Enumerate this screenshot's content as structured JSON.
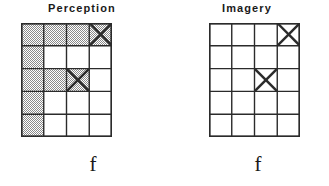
{
  "figure": {
    "background_color": "#ffffff",
    "stroke_color": "#2b2b2b",
    "shade_color": "#8a8a8a",
    "grid": {
      "columns": 4,
      "rows": 5
    }
  },
  "panels": [
    {
      "key": "perception",
      "title": "Perception",
      "label": "f",
      "shaded_cells": [
        [
          1,
          1
        ],
        [
          1,
          2
        ],
        [
          1,
          3
        ],
        [
          1,
          4
        ],
        [
          2,
          1
        ],
        [
          3,
          1
        ],
        [
          3,
          2
        ],
        [
          3,
          3
        ],
        [
          4,
          1
        ],
        [
          5,
          1
        ]
      ],
      "x_marks": [
        {
          "row": 1,
          "col": 4
        },
        {
          "row": 3,
          "col": 3
        }
      ]
    },
    {
      "key": "imagery",
      "title": "Imagery",
      "label": "f",
      "shaded_cells": [],
      "x_marks": [
        {
          "row": 1,
          "col": 4
        },
        {
          "row": 3,
          "col": 3
        }
      ]
    }
  ]
}
